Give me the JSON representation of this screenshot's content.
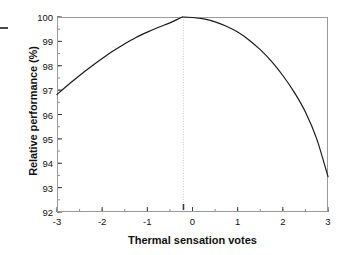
{
  "chart_data": {
    "type": "line",
    "title": "",
    "xlabel": "Thermal sensation votes",
    "ylabel": "Relative performance (%)",
    "xlim": [
      -3,
      3
    ],
    "ylim": [
      92,
      100
    ],
    "xticks": [
      -3,
      -2,
      -1,
      0,
      1,
      2,
      3
    ],
    "xtick_labels": [
      "-3",
      "-2",
      "-1",
      "0",
      "1",
      "2",
      "3"
    ],
    "yticks": [
      92,
      93,
      94,
      95,
      96,
      97,
      98,
      99,
      100
    ],
    "ytick_labels": [
      "92",
      "93",
      "94",
      "95",
      "96",
      "97",
      "98",
      "99",
      "100"
    ],
    "minor_tick_step_x": 0.5,
    "minor_tick_step_y": 0.5,
    "grid": false,
    "legend": null,
    "series": [
      {
        "name": "Relative performance",
        "color": "#1a1a1a",
        "x": [
          -3.0,
          -2.75,
          -2.5,
          -2.25,
          -2.0,
          -1.75,
          -1.5,
          -1.25,
          -1.0,
          -0.75,
          -0.5,
          -0.25,
          -0.2,
          0.0,
          0.25,
          0.5,
          0.75,
          1.0,
          1.25,
          1.5,
          1.75,
          2.0,
          2.25,
          2.5,
          2.75,
          3.0
        ],
        "y": [
          96.82,
          97.22,
          97.6,
          97.96,
          98.3,
          98.62,
          98.9,
          99.16,
          99.38,
          99.58,
          99.76,
          99.98,
          100.0,
          99.98,
          99.92,
          99.8,
          99.62,
          99.38,
          99.06,
          98.66,
          98.18,
          97.6,
          96.92,
          96.1,
          95.0,
          93.45
        ]
      }
    ],
    "annotations": [
      {
        "name": "optimum-marker",
        "type": "vertical-dotted-line",
        "x": -0.2,
        "y_from": 92,
        "y_to": 100,
        "color": "#bfbfbf"
      },
      {
        "name": "optimum-axis-tick",
        "type": "axis-marker",
        "x": -0.2,
        "color": "#3a3a3a"
      }
    ]
  },
  "figure": {
    "background_color": "#ffffff",
    "frame_color": "#9a9a9a",
    "curve_color": "#1a1a1a"
  }
}
